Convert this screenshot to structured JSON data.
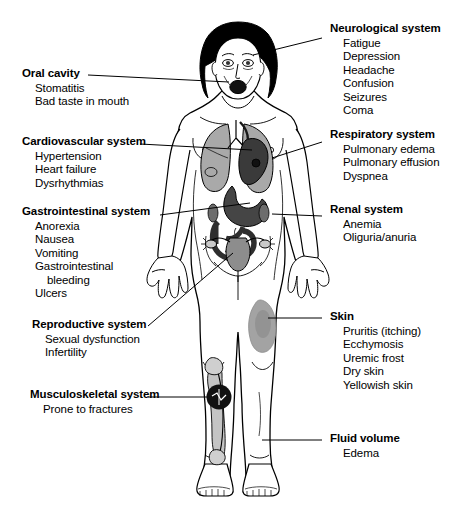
{
  "diagram": {
    "figure": {
      "name": "female-body-anterior-view",
      "organs": [
        {
          "name": "lungs",
          "shade": "#9a9a9a"
        },
        {
          "name": "heart",
          "shade": "#3a3a3a"
        },
        {
          "name": "stomach",
          "shade": "#444444"
        },
        {
          "name": "intestines",
          "shade": "#2f2f2f"
        },
        {
          "name": "uterus-ovaries",
          "shade": "#8d8d8d"
        },
        {
          "name": "skin-lesion-thigh",
          "shade": "#9e9e9e"
        },
        {
          "name": "tibia-fracture-site",
          "shade": "#111111"
        }
      ]
    },
    "callouts": [
      {
        "id": "neurological",
        "title": "Neurological system",
        "items": [
          "Fatigue",
          "Depression",
          "Headache",
          "Confusion",
          "Seizures",
          "Coma"
        ]
      },
      {
        "id": "oral",
        "title": "Oral cavity",
        "items": [
          "Stomatitis",
          "Bad taste in mouth"
        ]
      },
      {
        "id": "cardiovascular",
        "title": "Cardiovascular system",
        "items": [
          "Hypertension",
          "Heart failure",
          "Dysrhythmias"
        ]
      },
      {
        "id": "respiratory",
        "title": "Respiratory system",
        "items": [
          "Pulmonary edema",
          "Pulmonary effusion",
          "Dyspnea"
        ]
      },
      {
        "id": "gastrointestinal",
        "title": "Gastrointestinal system",
        "items": [
          "Anorexia",
          "Nausea",
          "Vomiting",
          "Gastrointestinal",
          "bleeding",
          "Ulcers"
        ]
      },
      {
        "id": "renal",
        "title": "Renal system",
        "items": [
          "Anemia",
          "Oliguria/anuria"
        ]
      },
      {
        "id": "reproductive",
        "title": "Reproductive system",
        "items": [
          "Sexual dysfunction",
          "Infertility"
        ]
      },
      {
        "id": "skin",
        "title": "Skin",
        "items": [
          "Pruritis (itching)",
          "Ecchymosis",
          "Uremic frost",
          "Dry skin",
          "Yellowish skin"
        ]
      },
      {
        "id": "musculoskeletal",
        "title": "Musculoskeletal system",
        "items": [
          "Prone to fractures"
        ]
      },
      {
        "id": "fluid",
        "title": "Fluid volume",
        "items": [
          "Edema"
        ]
      }
    ],
    "colors": {
      "line": "#000000",
      "text": "#000000",
      "background": "#ffffff",
      "organ_light": "#b5b5b5",
      "organ_mid": "#7d7d7d",
      "organ_dark": "#2e2e2e"
    }
  }
}
